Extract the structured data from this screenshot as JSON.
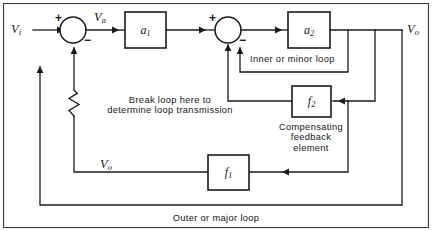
{
  "diagram": {
    "type": "block-diagram",
    "width": 432,
    "height": 231,
    "background_color": "#ffffff",
    "line_color": "#1a1a1a",
    "signals": {
      "input": "V",
      "input_sub": "i",
      "error": "V",
      "error_sub": "a",
      "output": "V",
      "output_sub": "o",
      "feedback_tap": "V",
      "feedback_tap_sub": "o"
    },
    "blocks": [
      {
        "id": "a1",
        "label": "a",
        "sub": "1",
        "role": "forward-gain-stage-1"
      },
      {
        "id": "a2",
        "label": "a",
        "sub": "2",
        "role": "forward-gain-stage-2"
      },
      {
        "id": "f2",
        "label": "f",
        "sub": "2",
        "role": "compensating-feedback-element"
      },
      {
        "id": "f1",
        "label": "f",
        "sub": "1",
        "role": "major-loop-feedback-element"
      }
    ],
    "summing_junctions": [
      {
        "id": "sum1",
        "plus": "+",
        "minus": "−"
      },
      {
        "id": "sum2",
        "plus": "+",
        "minus": "−"
      }
    ],
    "annotations": {
      "break_loop_line1": "Break loop here to",
      "break_loop_line2": "determine loop transmission",
      "inner_loop": "Inner or minor loop",
      "compensating_line1": "Compensating",
      "compensating_line2": "feedback",
      "compensating_line3": "element",
      "outer_loop": "Outer or major loop"
    }
  }
}
